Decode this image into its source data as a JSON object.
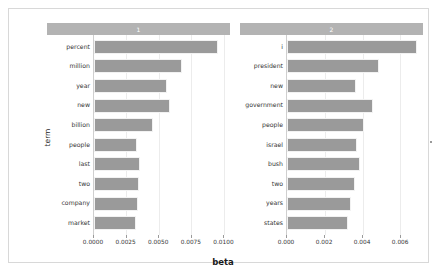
{
  "chart_data": {
    "type": "bar",
    "title": "",
    "subtitle": "",
    "xlabel": "beta",
    "ylabel": "term",
    "orientation": "horizontal",
    "grid": true,
    "legend": "none",
    "bar_color": "#9a9a9a",
    "strip_color": "#b3b3b3",
    "facet_variable": "topic",
    "facets": [
      {
        "label": "1",
        "categories": [
          "percent",
          "million",
          "year",
          "new",
          "billion",
          "people",
          "last",
          "two",
          "company",
          "market"
        ],
        "values": [
          0.00955,
          0.0068,
          0.00565,
          0.0059,
          0.00455,
          0.00335,
          0.00355,
          0.0035,
          0.0034,
          0.00325
        ],
        "xlim": [
          0.0,
          0.0105
        ],
        "xticks": [
          0.0,
          0.0025,
          0.005,
          0.0075,
          0.01
        ],
        "xticklabels": [
          "0.0000",
          "0.0025",
          "0.0050",
          "0.0075",
          "0.0100"
        ]
      },
      {
        "label": "2",
        "categories": [
          "i",
          "president",
          "new",
          "government",
          "people",
          "israel",
          "bush",
          "two",
          "years",
          "states"
        ],
        "values": [
          0.0069,
          0.00485,
          0.00365,
          0.00455,
          0.00405,
          0.0037,
          0.00385,
          0.0036,
          0.0034,
          0.00325
        ],
        "xlim": [
          0.0,
          0.0072
        ],
        "xticks": [
          0.0,
          0.002,
          0.004,
          0.006
        ],
        "xticklabels": [
          "0.000",
          "0.002",
          "0.004",
          "0.006"
        ]
      }
    ]
  }
}
